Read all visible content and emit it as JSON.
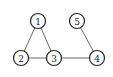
{
  "graph": {
    "nodes": [
      {
        "id": "1",
        "label": "1",
        "x": 38,
        "y": 21
      },
      {
        "id": "2",
        "label": "2",
        "x": 21,
        "y": 58
      },
      {
        "id": "3",
        "label": "3",
        "x": 54,
        "y": 58
      },
      {
        "id": "4",
        "label": "4",
        "x": 97,
        "y": 58
      },
      {
        "id": "5",
        "label": "5",
        "x": 77,
        "y": 21
      }
    ],
    "edges": [
      {
        "from": "1",
        "to": "2"
      },
      {
        "from": "1",
        "to": "3"
      },
      {
        "from": "2",
        "to": "3"
      },
      {
        "from": "3",
        "to": "4"
      },
      {
        "from": "5",
        "to": "4"
      }
    ],
    "node_radius": 7.5,
    "colors": {
      "edge": "#6a6a6a",
      "node_stroke": "#222222",
      "node_fill": "#ffffff"
    }
  }
}
